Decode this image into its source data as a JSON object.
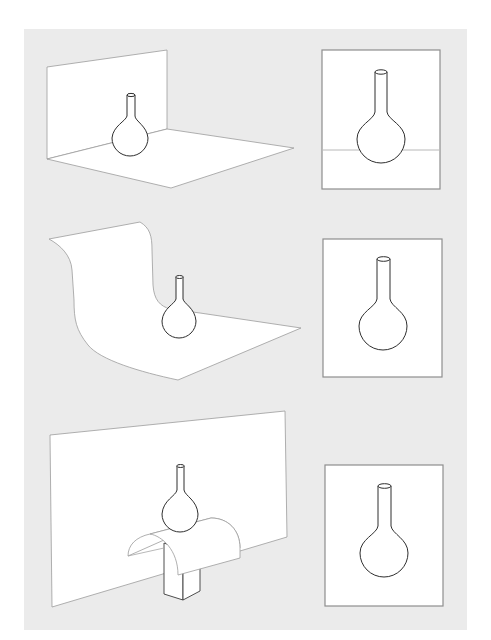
{
  "figure": {
    "colors": {
      "panel_background": "#ebebeb",
      "page_background": "#ffffff",
      "surface_fill": "#ffffff",
      "surface_outline": "#9c9c9c",
      "object_outline": "#2e2e2e",
      "frame_outline": "#8e8e8e"
    },
    "rows": [
      {
        "setup": "corner-backdrop",
        "setup_label": "Flat floor with vertical back wall (visible corner seam)",
        "result": "Framed view shows horizon line behind flask"
      },
      {
        "setup": "sweep-backdrop",
        "setup_label": "Curved seamless sweep backdrop",
        "result": "Framed view shows flask on seamless background"
      },
      {
        "setup": "elevated-drape-backdrop",
        "setup_label": "Flask raised on block with curved drape in front of vertical backdrop",
        "result": "Framed view shows flask on seamless background"
      }
    ]
  }
}
